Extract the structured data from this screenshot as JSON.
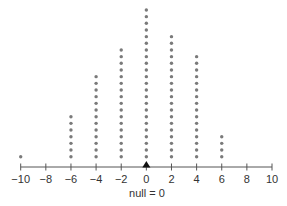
{
  "chart_data": {
    "type": "scatter",
    "subtype": "dot-plot",
    "title": "",
    "xlabel": "null = 0",
    "ylabel": "",
    "xlim": [
      -10,
      10
    ],
    "x_ticks": [
      -10,
      -8,
      -6,
      -4,
      -2,
      0,
      2,
      4,
      6,
      8,
      10
    ],
    "x_tick_labels": [
      "−10",
      "−8",
      "−6",
      "−4",
      "−2",
      "0",
      "2",
      "4",
      "6",
      "8",
      "10"
    ],
    "categories": [
      -10,
      -6,
      -4,
      -2,
      0,
      2,
      4,
      6
    ],
    "values": [
      1,
      7,
      13,
      17,
      23,
      19,
      16,
      4
    ],
    "null_value": 0,
    "null_marker": "triangle",
    "grid": false,
    "legend": null,
    "colors": {
      "dot": "#7a7a7a",
      "axis": "#555555",
      "marker": "#111111",
      "text": "#333333"
    }
  }
}
